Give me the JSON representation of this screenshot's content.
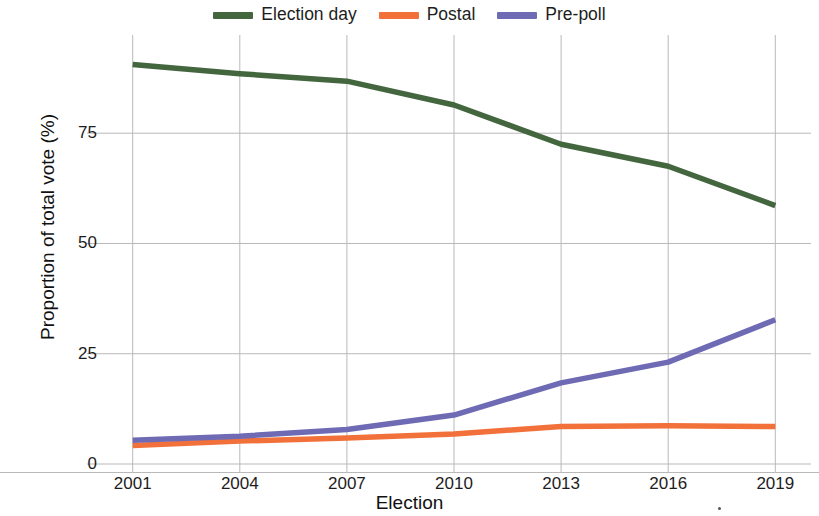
{
  "chart_data": {
    "type": "line",
    "title": "",
    "xlabel": "Election",
    "ylabel": "Proportion of total vote (%)",
    "categories": [
      "2001",
      "2004",
      "2007",
      "2010",
      "2013",
      "2016",
      "2019"
    ],
    "x": [
      2001,
      2004,
      2007,
      2010,
      2013,
      2016,
      2019
    ],
    "xlim": [
      2000,
      2020
    ],
    "ylim": [
      0,
      95
    ],
    "ytick_labels": [
      "0",
      "25",
      "50",
      "75"
    ],
    "yticks": [
      0,
      25,
      50,
      75
    ],
    "xtick_labels": [
      "2001",
      "2004",
      "2007",
      "2010",
      "2013",
      "2016",
      "2019"
    ],
    "grid": true,
    "legend_position": "top-center",
    "series": [
      {
        "name": "Election day",
        "color": "#43663f",
        "values": [
          90.6,
          88.5,
          86.8,
          81.4,
          72.5,
          67.5,
          58.6
        ]
      },
      {
        "name": "Postal",
        "color": "#f2713a",
        "values": [
          4.2,
          5.2,
          5.9,
          6.8,
          8.5,
          8.7,
          8.5
        ]
      },
      {
        "name": "Pre-poll",
        "color": "#6e6ab4",
        "values": [
          5.4,
          6.3,
          7.8,
          11.1,
          18.4,
          23.1,
          32.7
        ]
      }
    ]
  },
  "legend": {
    "entries": [
      {
        "label": "Election day",
        "color": "#43663f"
      },
      {
        "label": "Postal",
        "color": "#f2713a"
      },
      {
        "label": "Pre-poll",
        "color": "#6e6ab4"
      }
    ]
  },
  "axes": {
    "y_title": "Proportion of total vote (%)",
    "x_title": "Election"
  }
}
